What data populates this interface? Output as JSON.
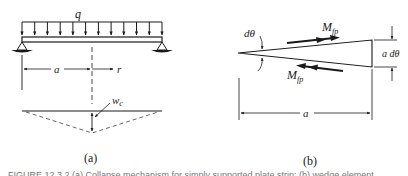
{
  "figure": {
    "panel_a": {
      "label": "(a)",
      "load_label": "q",
      "dim_left_label": "a",
      "dim_right_label": "r",
      "deflection_label": "w",
      "deflection_sub": "c"
    },
    "panel_b": {
      "label": "(b)",
      "angle_label": "dθ",
      "moment_top_label": "M",
      "moment_top_sub": "fp",
      "moment_bottom_label": "M",
      "moment_bottom_sub": "fp",
      "height_label": "a dθ",
      "length_label": "a"
    },
    "caption": "FIGURE 12.3.2 (a) Collapse mechanism for simply supported plate strip; (b) wedge element"
  }
}
